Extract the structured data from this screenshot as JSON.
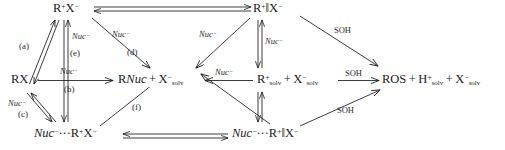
{
  "diagram": {
    "ink_color": "#1a1a1a",
    "species": {
      "contact_ion_pair": "R⁺X⁻",
      "solvent_separated_ion_pair": "R⁺ ‖ X⁻",
      "substrate": "RX",
      "substitution_product": "RNuc + X⁻solv",
      "free_ions": "R⁺solv + X⁻solv",
      "elimination_solvolysis_product": "ROS + H⁺solv + X⁻solv",
      "nuc_contact_ion_pair": "Nuc⁻···R⁺X⁻",
      "nuc_solvent_separated_ion_pair": "Nuc⁻···R⁺ ‖ X⁻"
    },
    "reagent_labels": {
      "nucleophile": "Nuc⁻",
      "solvent": "SOH"
    },
    "step_labels": {
      "a": "(a)",
      "b": "(b)",
      "c": "(c)",
      "d": "(d)",
      "e": "(e)",
      "f": "(f)"
    },
    "nuc_label_count": 7,
    "soh_label_count": 3
  }
}
